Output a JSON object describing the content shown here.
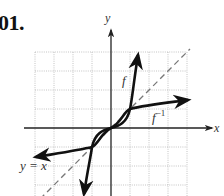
{
  "problem": {
    "number": "01."
  },
  "graph": {
    "axis_labels": {
      "x": "x",
      "y": "y"
    },
    "curve_labels": {
      "f": "f",
      "f_inverse": "f",
      "f_inverse_sup": "−1",
      "identity": "y = x"
    },
    "colors": {
      "curve": "#111111",
      "axis": "#222222",
      "grid": "#b5b5b5",
      "identity_line": "#777777"
    }
  }
}
